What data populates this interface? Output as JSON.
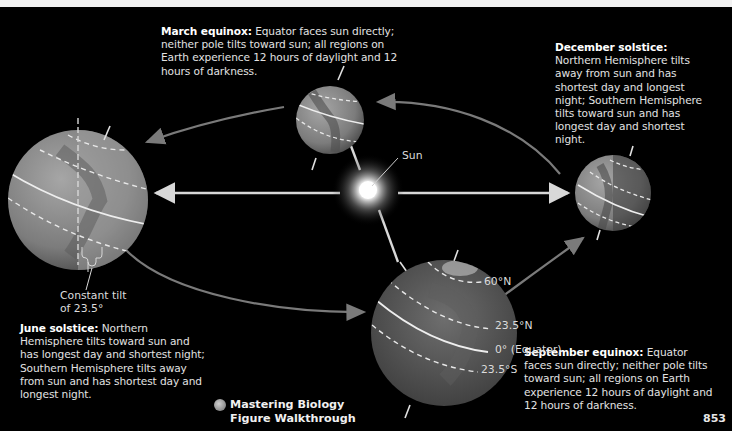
{
  "figure": {
    "sun_label": "Sun",
    "tilt_label_line1": "Constant tilt",
    "tilt_label_line2": "of 23.5°",
    "latitude_labels": {
      "lat60n": "60°N",
      "lat235n": "23.5°N",
      "equator": "0° (Equator)",
      "lat235s": "23.5°S"
    },
    "captions": {
      "march": {
        "heading": "March equinox:",
        "body": "Equator faces sun directly; neither pole tilts toward sun; all regions on Earth experience 12 hours of daylight and 12 hours of darkness."
      },
      "december": {
        "heading": "December solstice:",
        "body": "Northern Hemisphere tilts away from sun and has shortest day and longest night; Southern Hemisphere tilts toward sun and has longest day and shortest night."
      },
      "june": {
        "heading": "June solstice:",
        "body": "Northern Hemisphere tilts toward sun and has longest day and shortest night; Southern Hemisphere tilts away from sun and has shortest day and longest night."
      },
      "september": {
        "heading": "September equinox:",
        "body": "Equator faces sun directly; neither pole tilts toward sun; all regions on Earth experience 12 hours of daylight and 12 hours of darkness."
      }
    },
    "resource_link_line1": "Mastering Biology",
    "resource_link_line2": "Figure Walkthrough",
    "page_number": "853"
  },
  "colors": {
    "background": "#000000",
    "globe": "#8a8a8a",
    "orbit_arrow": "#7a7a7a",
    "sun_ray": "#d8d8d8"
  }
}
